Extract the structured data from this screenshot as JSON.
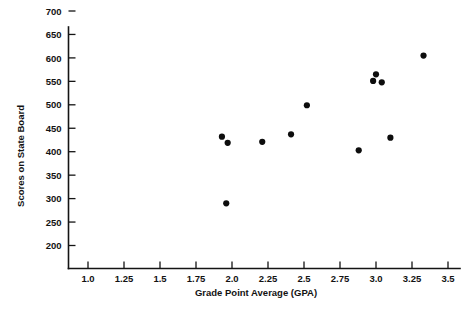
{
  "chart_data": {
    "type": "scatter",
    "title": "",
    "xlabel": "Grade Point Average (GPA)",
    "ylabel": "Scores on State Board",
    "xlim": [
      0.875,
      3.625
    ],
    "ylim": [
      175,
      725
    ],
    "grid": false,
    "legend": false,
    "xticks": [
      "1.0",
      "1.25",
      "1.5",
      "1.75",
      "2.0",
      "2.25",
      "2.5",
      "2.75",
      "3.0",
      "3.25",
      "3.5"
    ],
    "xtick_values": [
      1.0,
      1.25,
      1.5,
      1.75,
      2.0,
      2.25,
      2.5,
      2.75,
      3.0,
      3.25,
      3.5
    ],
    "yticks": [
      "200",
      "250",
      "300",
      "350",
      "400",
      "450",
      "500",
      "550",
      "600",
      "650",
      "700"
    ],
    "ytick_values": [
      200,
      250,
      300,
      350,
      400,
      450,
      500,
      550,
      600,
      650,
      700
    ],
    "marker": "filled-circle",
    "marker_color": "#0d0d0d",
    "marker_size": 3.1,
    "points": [
      {
        "x": 1.93,
        "y": 432
      },
      {
        "x": 1.97,
        "y": 419
      },
      {
        "x": 1.96,
        "y": 290
      },
      {
        "x": 2.21,
        "y": 421
      },
      {
        "x": 2.41,
        "y": 437
      },
      {
        "x": 2.52,
        "y": 499
      },
      {
        "x": 2.88,
        "y": 403
      },
      {
        "x": 3.0,
        "y": 565
      },
      {
        "x": 2.98,
        "y": 551
      },
      {
        "x": 3.04,
        "y": 548
      },
      {
        "x": 3.1,
        "y": 430
      },
      {
        "x": 3.33,
        "y": 605
      }
    ],
    "n_points": 12
  },
  "axes": {
    "x_axis_name": "grade-point-average-axis",
    "y_axis_name": "scores-on-state-board-axis"
  }
}
